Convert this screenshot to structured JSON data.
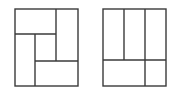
{
  "diagram": {
    "stroke_color": "#3a3a3a",
    "stroke_width": 1.4,
    "background": "#ffffff",
    "figures": [
      {
        "name": "left-partition",
        "outer": {
          "x": 15,
          "y": 9,
          "w": 63,
          "h": 77
        },
        "segments": [
          {
            "x1": 15,
            "y1": 34,
            "x2": 56,
            "y2": 34
          },
          {
            "x1": 56,
            "y1": 9,
            "x2": 56,
            "y2": 61
          },
          {
            "x1": 35,
            "y1": 34,
            "x2": 35,
            "y2": 86
          },
          {
            "x1": 35,
            "y1": 61,
            "x2": 78,
            "y2": 61
          }
        ]
      },
      {
        "name": "right-partition",
        "outer": {
          "x": 103,
          "y": 9,
          "w": 63,
          "h": 77
        },
        "segments": [
          {
            "x1": 124,
            "y1": 9,
            "x2": 124,
            "y2": 60
          },
          {
            "x1": 145,
            "y1": 9,
            "x2": 145,
            "y2": 86
          },
          {
            "x1": 103,
            "y1": 60,
            "x2": 166,
            "y2": 60
          }
        ]
      }
    ]
  }
}
